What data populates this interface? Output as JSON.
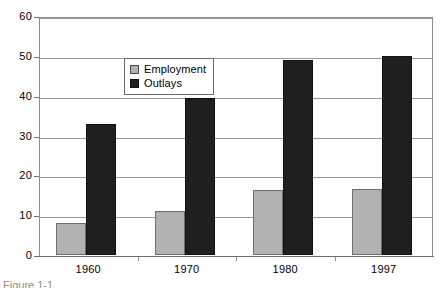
{
  "caption": "Figure 1-1",
  "colors": {
    "employment": "#b2b2b2",
    "outlays": "#1f1f1f",
    "gridline": "#9a9a9a",
    "frame": "#8d8d8d",
    "background": "#ffffff"
  },
  "legend": {
    "entries": [
      {
        "label": "Employment",
        "color": "#b2b2b2"
      },
      {
        "label": "Outlays",
        "color": "#1f1f1f"
      }
    ]
  },
  "axes": {
    "y_ticks": [
      "0",
      "10",
      "20",
      "30",
      "40",
      "50",
      "60"
    ],
    "x_ticks": [
      "1960",
      "1970",
      "1980",
      "1997"
    ]
  },
  "chart_data": {
    "type": "bar",
    "title": "",
    "subtitle": "",
    "xlabel": "",
    "ylabel": "",
    "categories": [
      "1960",
      "1970",
      "1980",
      "1997"
    ],
    "series": [
      {
        "name": "Employment",
        "values": [
          8,
          11,
          16.3,
          16.5
        ],
        "color": "#b2b2b2"
      },
      {
        "name": "Outlays",
        "values": [
          33,
          39.3,
          49,
          50
        ],
        "color": "#1f1f1f"
      }
    ],
    "ylim": [
      0,
      60
    ],
    "ytick_interval": 10,
    "yticks": [
      0,
      10,
      20,
      30,
      40,
      50,
      60
    ],
    "grid": true,
    "grid_axis": "y",
    "legend": true,
    "legend_position": "inside-upper-center",
    "bar_grouping": "clustered",
    "annotations": []
  }
}
